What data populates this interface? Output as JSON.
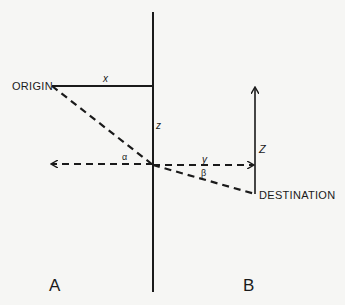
{
  "diagram": {
    "labels": {
      "origin": "ORIGIN",
      "destination": "DESTINATION",
      "x": "x",
      "z_left": "z",
      "z_right": "Z",
      "y": "y",
      "alpha": "α",
      "beta": "β",
      "panel_a": "A",
      "panel_b": "B"
    },
    "colors": {
      "background": "#f6f6f4",
      "ink": "#1a1a1a"
    }
  }
}
